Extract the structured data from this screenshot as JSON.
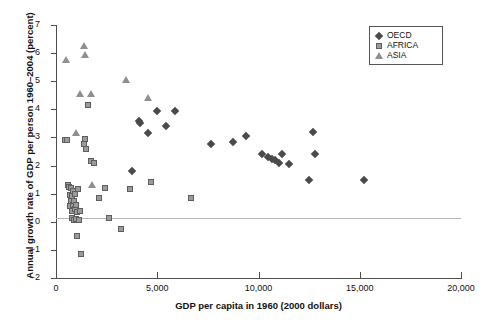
{
  "chart_data": {
    "type": "scatter",
    "title": "",
    "xlabel": "GDP per capita in 1960 (2000 dollars)",
    "ylabel": "Annual growth rate of GDP per person 1960–2004 (percent)",
    "xlim": [
      0,
      20000
    ],
    "ylim": [
      -2,
      7
    ],
    "xticks": [
      0,
      5000,
      10000,
      15000,
      20000
    ],
    "xtick_labels": [
      "0",
      "5,000",
      "10,000",
      "15,000",
      "20,000"
    ],
    "yticks": [
      -2,
      -1,
      0,
      1,
      2,
      3,
      4,
      5,
      6,
      7
    ],
    "ytick_labels": [
      "−2",
      "−1",
      "0",
      "1",
      "2",
      "3",
      "4",
      "5",
      "6",
      "7"
    ],
    "grid": false,
    "zero_reference_line": true,
    "legend_position": "top-right",
    "series": [
      {
        "name": "OECD",
        "marker": "diamond",
        "color": "#4a4a4a",
        "points": [
          [
            3750,
            1.8
          ],
          [
            4100,
            3.6
          ],
          [
            4150,
            3.5
          ],
          [
            4550,
            3.15
          ],
          [
            5000,
            3.95
          ],
          [
            5450,
            3.4
          ],
          [
            5900,
            3.95
          ],
          [
            7650,
            2.75
          ],
          [
            8750,
            2.85
          ],
          [
            9400,
            3.05
          ],
          [
            10150,
            2.4
          ],
          [
            10450,
            2.3
          ],
          [
            10650,
            2.25
          ],
          [
            10800,
            2.2
          ],
          [
            11000,
            2.1
          ],
          [
            11150,
            2.4
          ],
          [
            11500,
            2.05
          ],
          [
            12500,
            1.5
          ],
          [
            12700,
            3.2
          ],
          [
            12800,
            2.4
          ],
          [
            15200,
            1.5
          ]
        ]
      },
      {
        "name": "AFRICA",
        "marker": "square",
        "color": "#9b9b9b",
        "points": [
          [
            430,
            2.9
          ],
          [
            520,
            2.9
          ],
          [
            600,
            1.3
          ],
          [
            640,
            1.25
          ],
          [
            690,
            0.95
          ],
          [
            700,
            0.55
          ],
          [
            740,
            1.2
          ],
          [
            760,
            0.75
          ],
          [
            790,
            0.4
          ],
          [
            800,
            0.9
          ],
          [
            810,
            0.15
          ],
          [
            830,
            1.1
          ],
          [
            860,
            0.6
          ],
          [
            880,
            0.05
          ],
          [
            900,
            0.75
          ],
          [
            930,
            0.45
          ],
          [
            950,
            1.0
          ],
          [
            980,
            0.1
          ],
          [
            1000,
            0.6
          ],
          [
            1030,
            0.35
          ],
          [
            1050,
            -0.5
          ],
          [
            1100,
            1.15
          ],
          [
            1120,
            0.05
          ],
          [
            1180,
            0.4
          ],
          [
            1250,
            -1.15
          ],
          [
            1400,
            2.75
          ],
          [
            1430,
            2.95
          ],
          [
            1470,
            2.6
          ],
          [
            1600,
            4.15
          ],
          [
            1750,
            2.15
          ],
          [
            1900,
            2.1
          ],
          [
            2100,
            0.85
          ],
          [
            2400,
            1.2
          ],
          [
            2600,
            0.15
          ],
          [
            3200,
            -0.25
          ],
          [
            3650,
            1.15
          ],
          [
            4700,
            1.4
          ],
          [
            6650,
            0.85
          ]
        ]
      },
      {
        "name": "ASIA",
        "marker": "triangle",
        "color": "#8f8f8f",
        "points": [
          [
            480,
            5.75
          ],
          [
            1000,
            3.15
          ],
          [
            1200,
            4.55
          ],
          [
            1400,
            6.25
          ],
          [
            1450,
            5.95
          ],
          [
            1750,
            4.55
          ],
          [
            1800,
            1.3
          ],
          [
            3450,
            5.05
          ],
          [
            4550,
            4.4
          ]
        ]
      }
    ]
  },
  "legend": {
    "items": [
      {
        "label": "OECD",
        "marker": "diamond"
      },
      {
        "label": "AFRICA",
        "marker": "square"
      },
      {
        "label": "ASIA",
        "marker": "triangle"
      }
    ]
  }
}
